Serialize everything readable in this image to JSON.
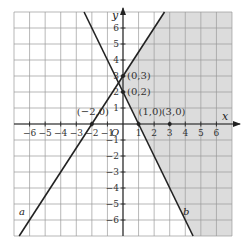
{
  "chart_data": {
    "type": "line",
    "title": "",
    "xlabel": "x",
    "ylabel": "y",
    "origin_label": "O",
    "xlim": [
      -7,
      7
    ],
    "ylim": [
      -7,
      7
    ],
    "grid": true,
    "x_ticks": [
      -6,
      -5,
      -4,
      -3,
      -2,
      -1,
      1,
      2,
      3,
      4,
      5,
      6
    ],
    "y_ticks": [
      -6,
      -5,
      -4,
      -3,
      -2,
      -1,
      1,
      2,
      3,
      4,
      5,
      6
    ],
    "x_tick_labels": [
      "−6",
      "−5",
      "−4",
      "−3",
      "−2",
      "−1",
      "1",
      "2",
      "3",
      "4",
      "5",
      "6"
    ],
    "y_tick_labels": [
      "−6",
      "−5",
      "−4",
      "−3",
      "−2",
      "−1",
      "1",
      "2",
      "3",
      "4",
      "5",
      "6"
    ],
    "series": [
      {
        "name": "a",
        "equation": "y = 1.5x + 3",
        "points": [
          [
            -2,
            0
          ],
          [
            0,
            3
          ]
        ]
      },
      {
        "name": "b",
        "equation": "y = -2x + 2",
        "points": [
          [
            0,
            2
          ],
          [
            1,
            0
          ]
        ]
      }
    ],
    "marked_points": [
      {
        "label": "(−2,0)",
        "x": -2,
        "y": 0
      },
      {
        "label": "(0,3)",
        "x": 0,
        "y": 3
      },
      {
        "label": "(0,2)",
        "x": 0,
        "y": 2
      },
      {
        "label": "(1,0)",
        "x": 1,
        "y": 0
      },
      {
        "label": "(3,0)",
        "x": 3,
        "y": 0
      }
    ],
    "shaded_region": "right of line a and right of line b (y ≤ 1.5x+3 and y ≥ −2x+2)",
    "colors": {
      "shade": "#dcdcdc",
      "grid": "#9a9a9a",
      "line": "#222222"
    }
  }
}
